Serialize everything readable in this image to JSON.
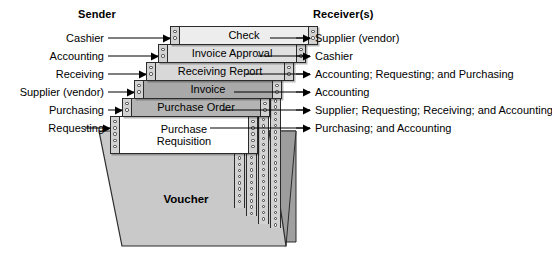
{
  "headings": {
    "sender": "Sender",
    "receiver": "Receiver(s)"
  },
  "colors": {
    "ink": "#000000",
    "doc_border": "#2b2b2b",
    "feed_strip": "#d2d2d2",
    "voucher_face": "#c9c9c9",
    "voucher_flap": "#a0a0a0",
    "shade_white": "#ffffff",
    "shade_light": "#e8e8e8",
    "shade_medium": "#d6d6d6",
    "shade_dark": "#ababab"
  },
  "rows": [
    {
      "sender": "Cashier",
      "document": "Check",
      "receiver": "Supplier (vendor)",
      "shade": "#ededed"
    },
    {
      "sender": "Accounting",
      "document": "Invoice Approval",
      "receiver": "Cashier",
      "shade": "#e0e0e0"
    },
    {
      "sender": "Receiving",
      "document": "Receiving Report",
      "receiver": "Accounting; Requesting; and Purchasing",
      "shade": "#d8d8d8"
    },
    {
      "sender": "Supplier (vendor)",
      "document": "Invoice",
      "receiver": "Accounting",
      "shade": "#a9a9a9"
    },
    {
      "sender": "Purchasing",
      "document": "Purchase Order",
      "receiver": "Supplier; Requesting; Receiving; and Accounting",
      "shade": "#b4b4b4"
    },
    {
      "sender": "Requesting",
      "document": "Purchase\nRequisition",
      "document_line1": "Purchase",
      "document_line2": "Requisition",
      "receiver": "Purchasing; and Accounting",
      "shade": "#ffffff"
    }
  ],
  "voucher": {
    "label": "Voucher"
  }
}
